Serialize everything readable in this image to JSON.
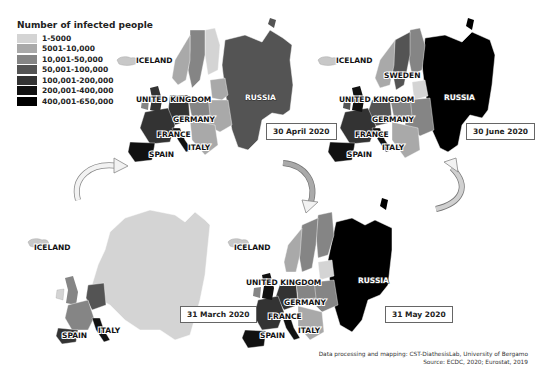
{
  "legend": {
    "title": "Number of infected people",
    "items": [
      {
        "label": "1-5000",
        "color": "#d4d4d4"
      },
      {
        "label": "5001-10,000",
        "color": "#a9a9a9"
      },
      {
        "label": "10,001-50,000",
        "color": "#858585"
      },
      {
        "label": "50,001-100,000",
        "color": "#545454"
      },
      {
        "label": "100,001-200,000",
        "color": "#333333"
      },
      {
        "label": "200,001-400,000",
        "color": "#111111"
      },
      {
        "label": "400,001-650,000",
        "color": "#000000"
      }
    ]
  },
  "maps": [
    {
      "date": "31 March 2020",
      "labels": [
        "ICELAND",
        "SPAIN",
        "ITALY"
      ]
    },
    {
      "date": "30 April 2020",
      "labels": [
        "ICELAND",
        "UNITED KINGDOM",
        "GERMANY",
        "FRANCE",
        "SPAIN",
        "ITALY",
        "RUSSIA"
      ]
    },
    {
      "date": "31 May 2020",
      "labels": [
        "ICELAND",
        "UNITED KINGDOM",
        "GERMANY",
        "FRANCE",
        "SPAIN",
        "ITALY",
        "RUSSIA"
      ]
    },
    {
      "date": "30 June 2020",
      "labels": [
        "ICELAND",
        "SWEDEN",
        "UNITED KINGDOM",
        "GERMANY",
        "FRANCE",
        "SPAIN",
        "ITALY",
        "RUSSIA"
      ]
    }
  ],
  "credits": {
    "line1": "Data processing and mapping: CST-DiathesisLab, University of Bergamo",
    "line2": "Source: ECDC, 2020; Eurostat, 2019"
  }
}
